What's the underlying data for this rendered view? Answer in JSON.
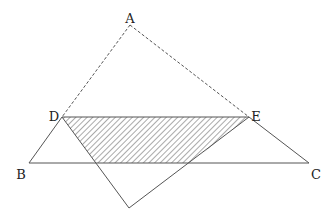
{
  "diagram": {
    "type": "geometry-fold",
    "points": {
      "A": {
        "label": "A",
        "x": 130,
        "y": 25,
        "lx": 130,
        "ly": 19
      },
      "B": {
        "label": "B",
        "x": 29,
        "y": 163,
        "lx": 21,
        "ly": 175
      },
      "C": {
        "label": "C",
        "x": 309,
        "y": 163,
        "lx": 316,
        "ly": 175
      },
      "D": {
        "label": "D",
        "x": 62,
        "y": 117,
        "lx": 54,
        "ly": 117
      },
      "E": {
        "label": "E",
        "x": 249,
        "y": 117,
        "lx": 256,
        "ly": 117
      },
      "A_prime": {
        "label": "",
        "x": 129,
        "y": 208
      }
    },
    "intersections": {
      "P": {
        "x": 96,
        "y": 163
      },
      "Q": {
        "x": 190,
        "y": 163
      }
    },
    "segments": {
      "dashed": [
        [
          "A",
          "D"
        ],
        [
          "A",
          "E"
        ]
      ],
      "solid": [
        [
          "D",
          "B"
        ],
        [
          "B",
          "C"
        ],
        [
          "C",
          "E"
        ],
        [
          "D",
          "E"
        ],
        [
          "D",
          "A_prime"
        ],
        [
          "A_prime",
          "E"
        ]
      ]
    },
    "shaded_region": [
      "D",
      "E",
      "Q",
      "P"
    ],
    "colors": {
      "line": "#555555",
      "hatch": "#555555",
      "label": "#222222",
      "background": "#ffffff"
    }
  }
}
